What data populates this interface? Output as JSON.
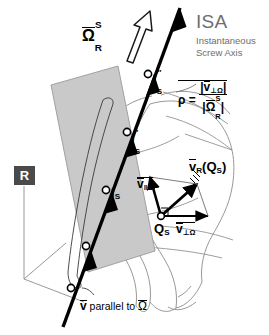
{
  "diagram": {
    "title": "ISA",
    "subtitle_line1": "Instantaneous",
    "subtitle_line2": "Screw Axis",
    "reference_frame_badge": "R",
    "angular_velocity": {
      "symbol": "Ω",
      "superscript": "S",
      "subscript": "R"
    },
    "rho": {
      "name": "ρ",
      "equals": "=",
      "numerator": {
        "symbol": "v",
        "subscript": "⊥Ω"
      },
      "denominator": {
        "symbol": "Ω",
        "superscript": "S",
        "subscript": "R"
      }
    },
    "axis_points": [
      {
        "label": "I",
        "prime": "″",
        "subscript": "S"
      },
      {
        "label": "I",
        "prime": "′",
        "subscript": "S"
      },
      {
        "label": "I",
        "prime": "",
        "subscript": "S"
      }
    ],
    "point_q": {
      "label": "Q",
      "subscript": "S"
    },
    "vectors": {
      "v_parallel": {
        "symbol": "v",
        "subscript": "‖Ω"
      },
      "v_perp": {
        "symbol": "v",
        "subscript": "⊥Ω"
      },
      "v_resultant": {
        "symbol": "v",
        "subscript": "R",
        "argument_open": "(",
        "argument": "Q",
        "argument_sub": "S",
        "argument_close": ")"
      }
    },
    "caption": {
      "vector": "v",
      "text": " parallel to ",
      "omega": "Ω"
    },
    "colors": {
      "axis": "#000000",
      "plane_fill": "#c9c9c9",
      "plane_stroke": "#8f8f8f",
      "surface_stroke": "#8c8c8c",
      "title_gray": "#6e6e6e",
      "badge_bg": "#4a4a4a",
      "background": "#ffffff"
    }
  }
}
